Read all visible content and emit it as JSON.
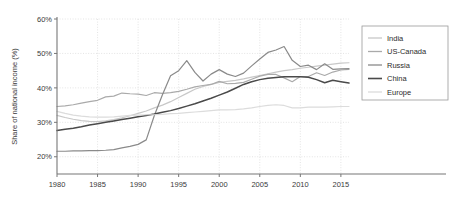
{
  "chart_data": {
    "type": "line",
    "title": "",
    "xlabel": "",
    "ylabel": "Share of national income (%)",
    "xlim": [
      1980,
      2016
    ],
    "ylim": [
      15,
      60
    ],
    "yticks": [
      20,
      30,
      40,
      50,
      60
    ],
    "ytick_labels": [
      "20%",
      "30%",
      "40%",
      "50%",
      "60%"
    ],
    "xticks": [
      1980,
      1985,
      1990,
      1995,
      2000,
      2005,
      2010,
      2015
    ],
    "xtick_labels": [
      "1980",
      "1985",
      "1990",
      "1995",
      "2000",
      "2005",
      "2010",
      "2015"
    ],
    "grid": true,
    "legend_position": "right",
    "x": [
      1980,
      1981,
      1982,
      1983,
      1984,
      1985,
      1986,
      1987,
      1988,
      1989,
      1990,
      1991,
      1992,
      1993,
      1994,
      1995,
      1996,
      1997,
      1998,
      1999,
      2000,
      2001,
      2002,
      2003,
      2004,
      2005,
      2006,
      2007,
      2008,
      2009,
      2010,
      2011,
      2012,
      2013,
      2014,
      2015,
      2016
    ],
    "series": [
      {
        "name": "India",
        "color": "#c8c8c8",
        "values": [
          32.0,
          31.4,
          30.9,
          30.5,
          30.3,
          30.2,
          30.4,
          30.8,
          31.3,
          31.9,
          32.6,
          33.3,
          34.2,
          35.0,
          36.0,
          37.2,
          38.4,
          39.6,
          40.4,
          41.0,
          41.6,
          41.9,
          42.2,
          42.6,
          43.1,
          43.6,
          44.1,
          44.6,
          45.0,
          45.3,
          45.7,
          46.0,
          46.3,
          46.6,
          46.9,
          47.2,
          47.3
        ]
      },
      {
        "name": "US-Canada",
        "color": "#aaaaaa",
        "values": [
          34.6,
          34.8,
          35.1,
          35.6,
          36.0,
          36.4,
          37.4,
          37.6,
          38.5,
          38.3,
          38.2,
          37.8,
          38.6,
          38.4,
          38.6,
          39.0,
          39.6,
          40.3,
          40.7,
          41.0,
          41.9,
          41.2,
          41.3,
          41.6,
          42.5,
          43.4,
          43.9,
          43.9,
          42.9,
          41.8,
          43.3,
          43.3,
          44.4,
          43.6,
          44.6,
          45.2,
          45.4
        ]
      },
      {
        "name": "Russia",
        "color": "#8a8a8a",
        "values": [
          21.6,
          21.6,
          21.7,
          21.7,
          21.8,
          21.8,
          21.9,
          22.1,
          22.6,
          23.0,
          23.6,
          24.9,
          32.0,
          38.0,
          43.5,
          45.0,
          47.9,
          44.5,
          42.0,
          44.0,
          45.3,
          44.0,
          43.3,
          44.3,
          46.4,
          48.4,
          50.3,
          51.0,
          52.0,
          48.0,
          46.2,
          46.6,
          45.3,
          47.0,
          45.4,
          45.5,
          45.6
        ]
      },
      {
        "name": "China",
        "color": "#4a4a4a",
        "values": [
          27.6,
          28.0,
          28.3,
          28.7,
          29.2,
          29.6,
          30.0,
          30.4,
          30.8,
          31.2,
          31.6,
          32.0,
          32.4,
          32.9,
          33.4,
          34.0,
          34.7,
          35.4,
          36.2,
          37.0,
          37.9,
          38.8,
          39.9,
          41.0,
          41.8,
          42.4,
          42.8,
          43.0,
          43.2,
          43.2,
          43.2,
          43.1,
          42.4,
          41.5,
          42.2,
          41.8,
          41.4
        ]
      },
      {
        "name": "Europe",
        "color": "#dcdcdc",
        "values": [
          33.2,
          32.6,
          32.1,
          31.8,
          31.6,
          31.5,
          31.5,
          31.6,
          31.8,
          32.0,
          32.1,
          32.2,
          32.2,
          32.3,
          32.5,
          32.6,
          32.8,
          33.0,
          33.2,
          33.4,
          33.6,
          33.6,
          33.7,
          33.9,
          34.2,
          34.6,
          34.9,
          35.1,
          34.9,
          34.2,
          34.2,
          34.4,
          34.4,
          34.4,
          34.5,
          34.6,
          34.6
        ]
      }
    ]
  },
  "legend": {
    "items": [
      {
        "label": "India"
      },
      {
        "label": "US-Canada"
      },
      {
        "label": "Russia"
      },
      {
        "label": "China"
      },
      {
        "label": "Europe"
      }
    ]
  }
}
